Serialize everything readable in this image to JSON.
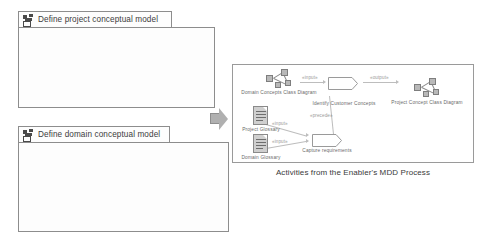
{
  "figure": {
    "caption": "Activities from the Enabler's MDD Process",
    "transition_arrow": "transition-arrow"
  },
  "packages": [
    {
      "id": "define-project-conceptual-model",
      "title": "Define project conceptual model",
      "icon": "package-icon",
      "actions": [
        {
          "id": "identify-domain-concepts",
          "label": "Identify domain concepts"
        },
        {
          "id": "build-domain-conceptual-model",
          "label": "Build domain conceptual model"
        }
      ],
      "artifacts": [
        {
          "id": "domain-glossary",
          "label": "Domain glossary",
          "kind": "document"
        },
        {
          "id": "domain-conceptual-model",
          "label": "Domain conceptual model",
          "kind": "model"
        }
      ],
      "connectors": [
        {
          "id": "output-1",
          "label": "«output»"
        },
        {
          "id": "precede-1",
          "label": "«precede»"
        },
        {
          "id": "input-1",
          "label": "«input»"
        },
        {
          "id": "output-2",
          "label": "«output»"
        }
      ]
    },
    {
      "id": "define-domain-conceptual-model",
      "title": "Define domain conceptual model",
      "icon": "package-icon",
      "actions": [
        {
          "id": "identify-project-concepts",
          "label": "Identify project concepts"
        },
        {
          "id": "build-project-concepts-model",
          "label": "Build project concepts model"
        }
      ],
      "artifacts": [
        {
          "id": "domain-glossary-2",
          "label": "Domain glossary",
          "kind": "document"
        },
        {
          "id": "project-glossary",
          "label": "Project glossary",
          "kind": "document"
        },
        {
          "id": "project-concept-model",
          "label": "Project concept model",
          "kind": "model"
        }
      ],
      "connectors": [
        {
          "id": "input-2",
          "label": "«input»"
        },
        {
          "id": "output-3",
          "label": "«output»"
        },
        {
          "id": "precede-2",
          "label": "«precede»"
        },
        {
          "id": "input-3",
          "label": "«input»"
        },
        {
          "id": "output-4",
          "label": "«output»"
        }
      ]
    }
  ],
  "right_panel": {
    "id": "enabler-mdd-process",
    "actions": [
      {
        "id": "identify-customer-concepts",
        "label": "Identify Customer Concepts"
      },
      {
        "id": "capture-requirements",
        "label": "Capture requirements"
      }
    ],
    "artifacts": [
      {
        "id": "domain-concepts-class-diagram",
        "label": "Domain Concepts Class Diagram",
        "kind": "model"
      },
      {
        "id": "project-concept-class-diagram",
        "label": "Project Concept Class Diagram",
        "kind": "model"
      },
      {
        "id": "project-glossary-r",
        "label": "Project Glossary",
        "kind": "document"
      },
      {
        "id": "domain-glossary-r",
        "label": "Domain Glossary",
        "kind": "document"
      }
    ],
    "connectors": [
      {
        "id": "r-input-1",
        "label": "«input»"
      },
      {
        "id": "r-output-1",
        "label": "«output»"
      },
      {
        "id": "r-precede-1",
        "label": "«precede»"
      },
      {
        "id": "r-input-2",
        "label": "«input»"
      },
      {
        "id": "r-input-3",
        "label": "«input»"
      }
    ]
  },
  "colors": {
    "frame_border": "#8d8d8d",
    "connector": "#bdbdbd",
    "artifact_fill": "#cfcfcf",
    "arrow_fill": "#b0b0b0",
    "text": "#6a6a6a"
  }
}
